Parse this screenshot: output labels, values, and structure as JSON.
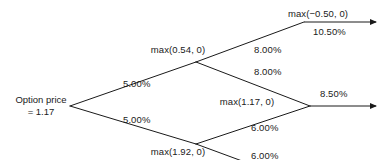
{
  "diagram": {
    "type": "binomial-option-pricing-tree",
    "background_color": "#ffffff",
    "line_color": "#1a1a1a",
    "text_color": "#1a1a1a",
    "root": {
      "line1": "Option price",
      "line2": "= 1.17"
    },
    "nodes": [
      {
        "id": "up",
        "label": "max(0.54, 0)"
      },
      {
        "id": "down",
        "label": "max(1.92, 0)"
      },
      {
        "id": "mid",
        "label": "max(1.17, 0)"
      },
      {
        "id": "up-up",
        "label": "max(−0.50, 0)"
      }
    ],
    "rate_labels": [
      {
        "id": "root-up",
        "text": "5.00%"
      },
      {
        "id": "root-down",
        "text": "5.00%"
      },
      {
        "id": "up-up-rate",
        "text": "8.00%"
      },
      {
        "id": "up-down-rate",
        "text": "8.00%"
      },
      {
        "id": "down-up-rate",
        "text": "6.00%"
      },
      {
        "id": "down-down-rate",
        "text": "6.00%"
      },
      {
        "id": "terminal-upper",
        "text": "10.50%"
      },
      {
        "id": "terminal-lower",
        "text": "8.50%"
      }
    ]
  }
}
